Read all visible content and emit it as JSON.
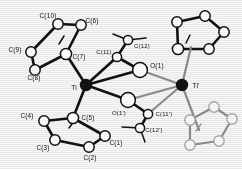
{
  "figure": {
    "type": "ortep-molecular-structure",
    "background_color": "#f7f6f4",
    "line_color": "#14110f",
    "atom_fill_open": "#ffffff",
    "atom_fill_metal": "#14110f",
    "bond_pale_color": "#8d8d8d"
  },
  "labels": [
    {
      "id": "C10",
      "text": "C(10)",
      "x": 48,
      "y": 16
    },
    {
      "id": "C6",
      "text": "C(6)",
      "x": 92,
      "y": 21
    },
    {
      "id": "C9",
      "text": "C(9)",
      "x": 15,
      "y": 50
    },
    {
      "id": "C7",
      "text": "C(7)",
      "x": 79,
      "y": 57
    },
    {
      "id": "C8",
      "text": "C(8)",
      "x": 34,
      "y": 78
    },
    {
      "id": "C11",
      "text": "C(11)",
      "x": 104,
      "y": 52
    },
    {
      "id": "C12",
      "text": "C(12)",
      "x": 142,
      "y": 46
    },
    {
      "id": "O1",
      "text": "O(1)",
      "x": 157,
      "y": 66
    },
    {
      "id": "Ti",
      "text": "Ti",
      "x": 74,
      "y": 88
    },
    {
      "id": "TiP",
      "text": "Ti'",
      "x": 196,
      "y": 86
    },
    {
      "id": "O1P",
      "text": "O(1')",
      "x": 119,
      "y": 113
    },
    {
      "id": "C11P",
      "text": "C(11')",
      "x": 164,
      "y": 114
    },
    {
      "id": "C12P",
      "text": "C(12')",
      "x": 154,
      "y": 130
    },
    {
      "id": "C4",
      "text": "C(4)",
      "x": 27,
      "y": 116
    },
    {
      "id": "C5",
      "text": "C(5)",
      "x": 88,
      "y": 118
    },
    {
      "id": "C1",
      "text": "C(1)",
      "x": 116,
      "y": 143
    },
    {
      "id": "C3",
      "text": "C(3)",
      "x": 43,
      "y": 148
    },
    {
      "id": "C2",
      "text": "C(2)",
      "x": 90,
      "y": 158
    }
  ],
  "atoms": [
    {
      "id": "C10",
      "x": 58,
      "y": 24,
      "r": 5.2,
      "kind": "open"
    },
    {
      "id": "C6",
      "x": 81,
      "y": 25,
      "r": 5.2,
      "kind": "open"
    },
    {
      "id": "C9",
      "x": 31,
      "y": 52,
      "r": 5.2,
      "kind": "open"
    },
    {
      "id": "C8",
      "x": 35,
      "y": 70,
      "r": 5.2,
      "kind": "open"
    },
    {
      "id": "C7",
      "x": 66,
      "y": 54,
      "r": 5.6,
      "kind": "open"
    },
    {
      "id": "C11",
      "x": 117,
      "y": 57,
      "r": 4.6,
      "kind": "open"
    },
    {
      "id": "C12",
      "x": 128,
      "y": 40,
      "r": 4.6,
      "kind": "open"
    },
    {
      "id": "O1",
      "x": 140,
      "y": 70,
      "r": 7.4,
      "kind": "open"
    },
    {
      "id": "Ti",
      "x": 86,
      "y": 85,
      "r": 5.6,
      "kind": "metal"
    },
    {
      "id": "TiP",
      "x": 182,
      "y": 85,
      "r": 5.6,
      "kind": "metal"
    },
    {
      "id": "O1P",
      "x": 128,
      "y": 100,
      "r": 7.4,
      "kind": "open"
    },
    {
      "id": "C11P",
      "x": 148,
      "y": 114,
      "r": 4.6,
      "kind": "open"
    },
    {
      "id": "C12P",
      "x": 140,
      "y": 128,
      "r": 4.6,
      "kind": "open"
    },
    {
      "id": "C5",
      "x": 73,
      "y": 118,
      "r": 5.6,
      "kind": "open"
    },
    {
      "id": "C4",
      "x": 44,
      "y": 121,
      "r": 5.2,
      "kind": "open"
    },
    {
      "id": "C3",
      "x": 55,
      "y": 140,
      "r": 5.2,
      "kind": "open"
    },
    {
      "id": "C2",
      "x": 89,
      "y": 147,
      "r": 5.2,
      "kind": "open"
    },
    {
      "id": "C1",
      "x": 105,
      "y": 136,
      "r": 5.2,
      "kind": "open"
    }
  ],
  "rings": [
    {
      "id": "cp-upper-left",
      "labeled": true,
      "members": [
        "C6",
        "C7",
        "C8",
        "C9",
        "C10"
      ]
    },
    {
      "id": "cp-lower-left",
      "labeled": true,
      "members": [
        "C1",
        "C2",
        "C3",
        "C4",
        "C5"
      ]
    },
    {
      "id": "cp-upper-right",
      "labeled": false,
      "members": []
    },
    {
      "id": "cp-lower-right",
      "labeled": false,
      "members": []
    }
  ],
  "core": {
    "id": "ti2o2-bridge",
    "vertices": [
      "Ti",
      "O(1)",
      "Ti'",
      "O(1')"
    ],
    "note": "planar four-membered Ti2O2 bridging core"
  }
}
